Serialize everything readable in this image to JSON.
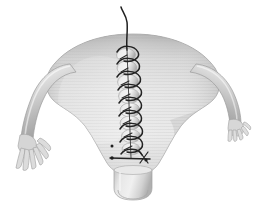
{
  "image": {
    "kind": "medical-illustration",
    "subject": "uterus-with-sutured-vertical-incision",
    "view": "anterior",
    "width": 267,
    "height": 206,
    "background_color": "#ffffff",
    "rendering": "grayscale-shaded-line-drawing",
    "alt_text": "Grayscale anatomical illustration of a uterus seen from the front, with both fallopian tubes ending in fimbriae, the cervix below, and a vertical midline incision closed by a running spiral suture."
  },
  "palette": {
    "background": "#ffffff",
    "tissue_light": "#e9e9e9",
    "tissue_mid": "#cfcfcf",
    "tissue_dark": "#a9a9a9",
    "tissue_shadow": "#8f8f8f",
    "outline": "#9a9a9a",
    "suture_thread": "#2a2a2a",
    "bulge_light": "#f0f0f0",
    "bulge_shadow": "#b5b5b5",
    "striation": "#c6c6c6"
  },
  "anatomy": {
    "parts": [
      {
        "id": "uterine-fundus",
        "label": "Uterine fundus",
        "description": "Broad domed superior border of the uterine body",
        "center": [
          133,
          52
        ]
      },
      {
        "id": "uterine-body",
        "label": "Uterine body (corpus)",
        "description": "Inverted-pear shaped muscular body tapering downward",
        "center": [
          133,
          110
        ]
      },
      {
        "id": "cervix",
        "label": "Cervix",
        "description": "Short cylindrical neck at the inferior pole with a rounded external os",
        "center": [
          133,
          183
        ]
      },
      {
        "id": "external-os",
        "label": "External os",
        "description": "Rounded opening visible on the cervical tip",
        "center": [
          133,
          192
        ]
      },
      {
        "id": "left-fallopian-tube",
        "label": "Left fallopian tube",
        "description": "Tube arching laterally and downward from the left cornu",
        "center": [
          45,
          105
        ]
      },
      {
        "id": "left-fimbriae",
        "label": "Left fimbriae",
        "description": "Finger-like projections fanning downward at the tube end",
        "center": [
          28,
          145
        ],
        "finger_count": 6
      },
      {
        "id": "right-fallopian-tube",
        "label": "Right fallopian tube",
        "description": "Tube arching laterally and downward from the right cornu",
        "center": [
          222,
          100
        ]
      },
      {
        "id": "right-fimbriae",
        "label": "Right fimbriae",
        "description": "Short finger-like projections at the tube end",
        "center": [
          240,
          130
        ],
        "finger_count": 5
      }
    ]
  },
  "surgical": {
    "procedure_label": "Vertical midline uterine incision closure",
    "suture": {
      "type": "running-spiral-suture",
      "thread_color": "#2a2a2a",
      "incision_axis": "vertical-midline",
      "incision_top": [
        128,
        48
      ],
      "incision_bottom": [
        131,
        160
      ],
      "tissue_bulges": 8,
      "loop_count": 9,
      "free_tail": {
        "label": "Free suture tail",
        "description": "Thread continues upward past the fundus and curves to the left",
        "start": [
          128,
          48
        ],
        "end": [
          121,
          7
        ]
      },
      "anchor_bar": {
        "label": "Terminal anchor bar",
        "description": "Horizontal bar with knot points at the inferior end of the closure",
        "y": 158,
        "x_start": 110,
        "x_end": 150
      },
      "knots": [
        [
          112,
          158
        ],
        [
          146,
          160
        ]
      ]
    }
  }
}
